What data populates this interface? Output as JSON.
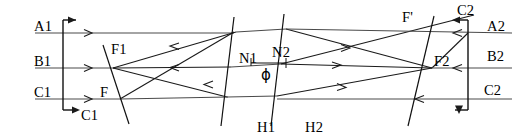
{
  "figure": {
    "kind": "optical-ray-diagram",
    "width": 526,
    "height": 139,
    "colors": {
      "background": "#ffffff",
      "ray": "#4a4a4a",
      "ray_dark": "#1a1a1a",
      "plane": "#111111",
      "text": "#000000"
    }
  },
  "labels": {
    "a1": "A1",
    "b1": "B1",
    "c1_left": "C1",
    "c1_bottom": "C1",
    "f1": "F1",
    "f_left": "F",
    "n1": "N1",
    "n2": "N2",
    "phi": "ϕ",
    "h1": "H1",
    "h2": "H2",
    "f_prime": "F'",
    "f2": "F2",
    "c2_top": "C2",
    "a2": "A2",
    "b2": "B2",
    "c2_right": "C2"
  },
  "label_positions": {
    "a1": {
      "x": 34,
      "y": 19
    },
    "b1": {
      "x": 34,
      "y": 54
    },
    "c1_left": {
      "x": 34,
      "y": 85
    },
    "c1_bottom": {
      "x": 81,
      "y": 112
    },
    "f1": {
      "x": 111,
      "y": 45
    },
    "f_left": {
      "x": 100,
      "y": 88
    },
    "n1": {
      "x": 240,
      "y": 54
    },
    "n2": {
      "x": 274,
      "y": 48
    },
    "phi": {
      "x": 263,
      "y": 71
    },
    "h1": {
      "x": 258,
      "y": 120
    },
    "h2": {
      "x": 306,
      "y": 120
    },
    "f_prime": {
      "x": 403,
      "y": 12
    },
    "f2": {
      "x": 434,
      "y": 57
    },
    "c2_top": {
      "x": 458,
      "y": 6
    },
    "a2": {
      "x": 488,
      "y": 22
    },
    "b2": {
      "x": 488,
      "y": 52
    },
    "c2_right": {
      "x": 485,
      "y": 86
    }
  },
  "axes": {
    "a_row_y": 33,
    "b_row_y": 68,
    "c_row_y": 99,
    "left_object_x": 63,
    "right_object_x": 468
  },
  "planes": [
    {
      "name": "f1-plane",
      "x1": 103,
      "y1": 45,
      "x2": 129,
      "y2": 124
    },
    {
      "name": "h1-plane",
      "x1": 234,
      "y1": 17,
      "x2": 221,
      "y2": 126
    },
    {
      "name": "h2-plane",
      "x1": 284,
      "y1": 14,
      "x2": 271,
      "y2": 126
    },
    {
      "name": "f2-plane",
      "x1": 434,
      "y1": 16,
      "x2": 408,
      "y2": 126
    }
  ],
  "rays": [
    {
      "name": "a1-incoming",
      "points": "35,33 234,33"
    },
    {
      "name": "a1-through",
      "points": "234,33 284,30"
    },
    {
      "name": "b1-incoming",
      "points": "35,68 112,68"
    },
    {
      "name": "c1-incoming",
      "points": "35,99 118,99"
    },
    {
      "name": "ray-f1-to-n1-upper",
      "points": "112,68 234,33"
    },
    {
      "name": "ray-f1-to-n1-axis",
      "points": "112,68 228,68"
    },
    {
      "name": "ray-f1-to-n1-lower",
      "points": "112,68 224,97"
    },
    {
      "name": "ray-c1-to-n1-upper",
      "points": "118,99 232,33"
    },
    {
      "name": "ray-n2-out-upper",
      "points": "284,30 430,68"
    },
    {
      "name": "ray-n2-out-axis",
      "points": "281,63 430,68"
    },
    {
      "name": "ray-n2-out-low",
      "points": "275,96 430,68"
    },
    {
      "name": "ray-n2-to-c2top",
      "points": "281,63 470,17"
    },
    {
      "name": "ray-f2-to-a2",
      "points": "430,68 468,33"
    },
    {
      "name": "a2-incoming",
      "points": "508,33 430,33"
    },
    {
      "name": "a2-level",
      "points": "430,33 284,30"
    },
    {
      "name": "b2-incoming",
      "points": "508,68 430,68"
    },
    {
      "name": "c2-incoming",
      "points": "508,99 275,99"
    },
    {
      "name": "c2-to-h2",
      "points": "275,99 275,96"
    }
  ],
  "arrow_markers": [
    {
      "name": "a1-ray-arrow",
      "x": 90,
      "y": 33,
      "dir": "right"
    },
    {
      "name": "b1-ray-arrow",
      "x": 90,
      "y": 68,
      "dir": "right"
    },
    {
      "name": "c1-ray-arrow",
      "x": 90,
      "y": 99,
      "dir": "right"
    },
    {
      "name": "b1-return-arrow",
      "x": 178,
      "y": 68,
      "dir": "left"
    },
    {
      "name": "upper-return-arrow",
      "x": 176,
      "y": 48,
      "dir": "left"
    },
    {
      "name": "lower-return-arrow",
      "x": 206,
      "y": 86,
      "dir": "left"
    },
    {
      "name": "n2-axis-arrow",
      "x": 340,
      "y": 65,
      "dir": "right"
    },
    {
      "name": "n2-upper-arrow",
      "x": 350,
      "y": 50,
      "dir": "right"
    },
    {
      "name": "n2-low-arrow",
      "x": 345,
      "y": 89,
      "dir": "right"
    },
    {
      "name": "a2-return-arrow",
      "x": 455,
      "y": 33,
      "dir": "left"
    },
    {
      "name": "b2-return-arrow",
      "x": 455,
      "y": 68,
      "dir": "left"
    },
    {
      "name": "c2-return-arrow",
      "x": 415,
      "y": 99,
      "dir": "left"
    }
  ],
  "object_arrows": [
    {
      "name": "left-top-arrow",
      "x": 63,
      "y": 20,
      "dir": "right"
    },
    {
      "name": "left-bottom-arrow",
      "x": 63,
      "y": 110,
      "dir": "right"
    },
    {
      "name": "right-top-arrow",
      "x": 468,
      "y": 20,
      "dir": "left"
    },
    {
      "name": "right-bottom-arrow",
      "x": 468,
      "y": 110,
      "dir": "left"
    }
  ]
}
